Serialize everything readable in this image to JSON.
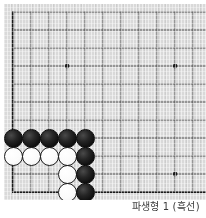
{
  "figure": {
    "kind": "go-board-diagram",
    "caption": {
      "prefix": "파생형",
      "number": "1",
      "suffix": "(흑선)",
      "full": "파생형 1 (흑선)"
    }
  },
  "board": {
    "game": "go",
    "visible_cols": 11,
    "visible_rows": 11,
    "cell_px": 18,
    "origin_x_px": 9,
    "origin_y_px": 8,
    "line_color": "#3a3a3a",
    "border_color": "#1a1a1a",
    "background_color": "#d9d9d9",
    "star_point_color": "#1a1a1a",
    "star_points": [
      {
        "col": 3,
        "row": 3
      },
      {
        "col": 9,
        "row": 3
      },
      {
        "col": 9,
        "row": 9
      }
    ],
    "stones": [
      {
        "color": "black",
        "col": 0,
        "row": 7
      },
      {
        "color": "black",
        "col": 1,
        "row": 7
      },
      {
        "color": "black",
        "col": 2,
        "row": 7
      },
      {
        "color": "black",
        "col": 3,
        "row": 7
      },
      {
        "color": "black",
        "col": 4,
        "row": 7
      },
      {
        "color": "white",
        "col": 0,
        "row": 8
      },
      {
        "color": "white",
        "col": 1,
        "row": 8
      },
      {
        "color": "white",
        "col": 2,
        "row": 8
      },
      {
        "color": "white",
        "col": 3,
        "row": 8
      },
      {
        "color": "black",
        "col": 4,
        "row": 8
      },
      {
        "color": "white",
        "col": 3,
        "row": 9
      },
      {
        "color": "black",
        "col": 4,
        "row": 9
      },
      {
        "color": "white",
        "col": 3,
        "row": 10
      },
      {
        "color": "black",
        "col": 4,
        "row": 10
      }
    ],
    "stone_diameter_px": 19,
    "black_stone_color": "#111111",
    "white_stone_color": "#fbfbfb"
  }
}
